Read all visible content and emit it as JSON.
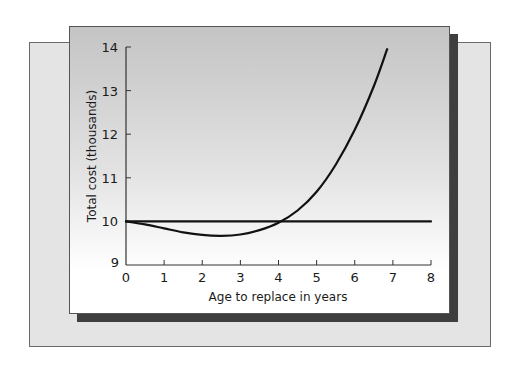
{
  "chart_data": {
    "type": "line",
    "title": "",
    "xlabel": "Age to replace in years",
    "ylabel": "Total cost (thousands)",
    "xlim": [
      0,
      8
    ],
    "ylim": [
      9,
      14
    ],
    "x_ticks": [
      "0",
      "1",
      "2",
      "3",
      "4",
      "5",
      "6",
      "7",
      "8"
    ],
    "y_ticks": [
      "9",
      "10",
      "11",
      "12",
      "13",
      "14"
    ],
    "grid": false,
    "legend": null,
    "series": [
      {
        "name": "Replacement policy total cost",
        "x": [
          0,
          0.5,
          1,
          1.5,
          2,
          2.5,
          3,
          3.5,
          4,
          4.5,
          5,
          5.5,
          6,
          6.5,
          6.85
        ],
        "y": [
          10.0,
          9.93,
          9.84,
          9.75,
          9.69,
          9.67,
          9.7,
          9.8,
          9.97,
          10.25,
          10.68,
          11.3,
          12.1,
          13.1,
          13.95
        ]
      },
      {
        "name": "Baseline (10 thousand)",
        "x": [
          0,
          8
        ],
        "y": [
          10.0,
          10.0
        ]
      }
    ],
    "annotations": []
  },
  "labels": {
    "xlabel": "Age to replace in years",
    "ylabel": "Total cost (thousands)",
    "x_ticks": [
      "0",
      "1",
      "2",
      "3",
      "4",
      "5",
      "6",
      "7",
      "8"
    ],
    "y_ticks": [
      "9",
      "10",
      "11",
      "12",
      "13",
      "14"
    ]
  },
  "colors": {
    "line": "#111111",
    "axis": "#333333",
    "back_panel": "#e4e4e4",
    "shadow": "#3f3f3f"
  }
}
